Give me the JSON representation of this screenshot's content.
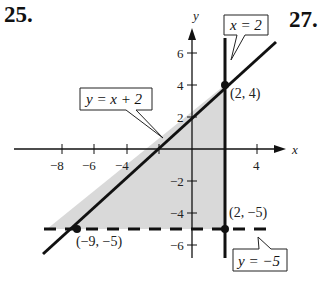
{
  "problem_numbers": {
    "left": "25.",
    "right": "27."
  },
  "axes": {
    "x_label": "x",
    "y_label": "y",
    "x_ticks": [
      {
        "value": -8,
        "label": "−8"
      },
      {
        "value": -6,
        "label": "−6"
      },
      {
        "value": -4,
        "label": "−4"
      },
      {
        "value": 4,
        "label": "4"
      }
    ],
    "y_ticks": [
      {
        "value": 6,
        "label": "6"
      },
      {
        "value": 4,
        "label": "4"
      },
      {
        "value": 2,
        "label": "2"
      },
      {
        "value": -2,
        "label": "−2"
      },
      {
        "value": -4,
        "label": "−4"
      },
      {
        "value": -6,
        "label": "−6"
      }
    ]
  },
  "lines": {
    "diagonal": {
      "equation": "y = x + 2",
      "style": "solid"
    },
    "vertical": {
      "equation": "x = 2",
      "style": "solid"
    },
    "horizontal": {
      "equation": "y = −5",
      "style": "dashed"
    }
  },
  "callouts": {
    "diagonal": "y = x + 2",
    "vertical": "x = 2",
    "horizontal": "y = −5"
  },
  "points": [
    {
      "label": "(2, 4)",
      "x": 2,
      "y": 4
    },
    {
      "label": "(2, −5)",
      "x": 2,
      "y": -5
    },
    {
      "label": "(−9, −5)",
      "x": -9,
      "y": -5
    }
  ],
  "colors": {
    "shade": "#d9d9d9",
    "ink": "#111111"
  }
}
